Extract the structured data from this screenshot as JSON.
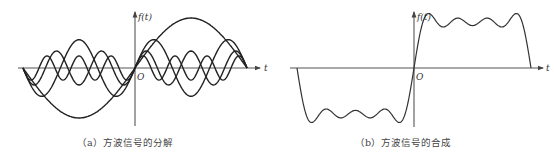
{
  "panels": [
    {
      "id": "a",
      "caption": "（a）方波信号的分解",
      "y_axis_label": "f(t)",
      "x_axis_label": "t",
      "origin_label": "O",
      "description": "Square wave decomposed into odd sine harmonics",
      "harmonics": [
        1,
        3,
        5,
        7
      ],
      "amplitudes": [
        1,
        0.3333,
        0.2,
        0.1429
      ]
    },
    {
      "id": "b",
      "caption": "（b）方波信号的合成",
      "y_axis_label": "f(t)",
      "x_axis_label": "t",
      "origin_label": "O",
      "description": "Sum of harmonics approximating a square wave",
      "harmonics": [
        1,
        3,
        5,
        7
      ]
    }
  ]
}
